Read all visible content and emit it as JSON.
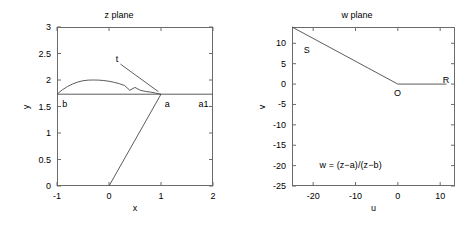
{
  "figure": {
    "width": 476,
    "height": 228,
    "background": "#ffffff",
    "axis_color": "#6b6b6b",
    "curve_color": "#4a4a4a"
  },
  "panels": [
    {
      "id": "z-plane",
      "title": "z plane",
      "xlabel": "x",
      "ylabel": "y",
      "xlim": [
        -1,
        2
      ],
      "ylim": [
        0,
        3
      ],
      "xticks": [
        "-1",
        "0",
        "1",
        "2"
      ],
      "xtick_values": [
        -1,
        0,
        1,
        2
      ],
      "yticks": [
        "0",
        "0.5",
        "1",
        "1.5",
        "2",
        "2.5",
        "3"
      ],
      "ytick_values": [
        0,
        0.5,
        1,
        1.5,
        2,
        2.5,
        3
      ],
      "annotations": [
        {
          "text": "b",
          "x": -0.9,
          "y": 1.52
        },
        {
          "text": "a",
          "x": 1.07,
          "y": 1.52
        },
        {
          "text": "a1",
          "x": 1.72,
          "y": 1.52
        },
        {
          "text": "t",
          "x": 0.13,
          "y": 2.37
        }
      ]
    },
    {
      "id": "w-plane",
      "title": "w plane",
      "xlabel": "u",
      "ylabel": "v",
      "xlim": [
        -25,
        13.5
      ],
      "ylim": [
        -25,
        14
      ],
      "xticks": [
        "-20",
        "-10",
        "0",
        "10"
      ],
      "xtick_values": [
        -20,
        -10,
        0,
        10
      ],
      "yticks": [
        "10",
        "5",
        "0",
        "-5",
        "-10",
        "-15",
        "-20",
        "-25"
      ],
      "ytick_values": [
        10,
        5,
        0,
        -5,
        -10,
        -15,
        -20,
        -25
      ],
      "annotations": [
        {
          "text": "S",
          "x": -22.2,
          "y": 8.0
        },
        {
          "text": "O",
          "x": -0.9,
          "y": -2.4
        },
        {
          "text": "R",
          "x": 10.6,
          "y": 0.8
        }
      ],
      "equation": "w = (z−a)/(z−b)",
      "equation_pos": {
        "x": -18.5,
        "y": -20.2
      }
    }
  ],
  "chart_data": [
    {
      "type": "line",
      "title": "z plane",
      "xlabel": "x",
      "ylabel": "y",
      "xlim": [
        -1,
        2
      ],
      "ylim": [
        0,
        3
      ],
      "grid": false,
      "legend": "none",
      "series": [
        {
          "name": "horizontal baseline b-a-a1",
          "x": [
            -1,
            2
          ],
          "y": [
            1.732,
            1.732
          ]
        },
        {
          "name": "arc from b over top to a",
          "x": [
            -1.0,
            -0.9,
            -0.8,
            -0.7,
            -0.6,
            -0.5,
            -0.4,
            -0.3,
            -0.2,
            -0.1,
            0.0,
            0.1,
            0.2,
            0.3,
            0.4,
            0.5,
            0.6,
            0.7,
            0.8,
            0.9,
            1.0
          ],
          "y": [
            1.732,
            1.812,
            1.876,
            1.925,
            1.962,
            1.986,
            1.998,
            2.0,
            1.998,
            1.99,
            1.976,
            1.956,
            1.93,
            1.896,
            1.806,
            1.86,
            1.806,
            1.785,
            1.772,
            1.752,
            1.732
          ]
        },
        {
          "name": "ray from origin to a",
          "x": [
            0,
            1
          ],
          "y": [
            0,
            1.732
          ]
        },
        {
          "name": "leader line for label t",
          "x": [
            0.22,
            0.95
          ],
          "y": [
            2.3,
            1.78
          ]
        }
      ],
      "point_labels": [
        {
          "text": "b",
          "x": -1,
          "y": 1.732
        },
        {
          "text": "a",
          "x": 1,
          "y": 1.732
        },
        {
          "text": "a1",
          "x": 1.72,
          "y": 1.732
        },
        {
          "text": "t",
          "x": 0.13,
          "y": 2.37
        }
      ]
    },
    {
      "type": "line",
      "title": "w plane",
      "xlabel": "u",
      "ylabel": "v",
      "xlim": [
        -25,
        13.5
      ],
      "ylim": [
        -25,
        14
      ],
      "grid": false,
      "legend": "none",
      "series": [
        {
          "name": "segment S to O",
          "x": [
            -25,
            0
          ],
          "y": [
            14,
            0
          ]
        },
        {
          "name": "segment O to R",
          "x": [
            0,
            11.5
          ],
          "y": [
            0,
            0
          ]
        }
      ],
      "point_labels": [
        {
          "text": "S",
          "x": -22.2,
          "y": 8.0
        },
        {
          "text": "O",
          "x": -0.9,
          "y": -2.4
        },
        {
          "text": "R",
          "x": 10.6,
          "y": 0.8
        }
      ],
      "annotations": [
        {
          "text": "w = (z−a)/(z−b)",
          "x": -18.5,
          "y": -20.2
        }
      ]
    }
  ]
}
